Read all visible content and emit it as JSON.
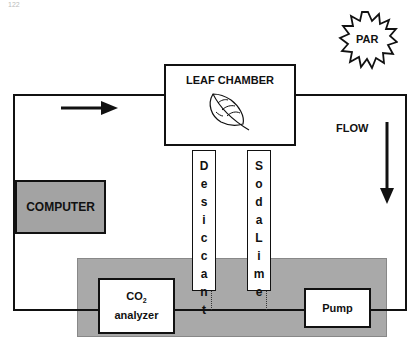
{
  "page": {
    "number": "122"
  },
  "diagram": {
    "leaf_chamber": {
      "label": "LEAF CHAMBER",
      "icon": "leaf-icon"
    },
    "light_source": {
      "label": "PAR",
      "shape": "starburst"
    },
    "flow_label": "FLOW",
    "computer": {
      "label": "COMPUTER"
    },
    "desiccant": {
      "letters": [
        "D",
        "e",
        "s",
        "i",
        "c",
        "c",
        "a",
        "n",
        "t"
      ],
      "label": "Desiccant"
    },
    "soda_lime": {
      "letters": [
        "S",
        "o",
        "d",
        "a",
        "",
        "L",
        "i",
        "m",
        "e"
      ],
      "label": "Soda Lime"
    },
    "co2_analyzer": {
      "line1": "CO",
      "subscript": "2",
      "line2": "analyzer"
    },
    "pump": {
      "label": "Pump"
    },
    "colors": {
      "line": "#111111",
      "panel_gray": "#a9a9a9",
      "computer_gray": "#a3a3a3"
    }
  }
}
